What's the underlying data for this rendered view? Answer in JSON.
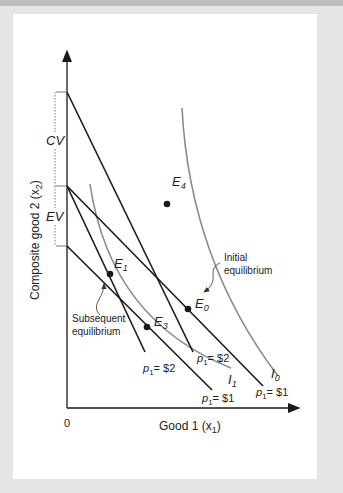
{
  "figure": {
    "y_axis_label": "Composite good 2 (x",
    "y_axis_sub": "2",
    "x_axis_label": "Good 1 (x",
    "x_axis_sub": "1",
    "origin_label": "0",
    "brackets": {
      "cv": "CV",
      "ev": "EV"
    },
    "points": {
      "e0": {
        "letter": "E",
        "sub": "0"
      },
      "e1": {
        "letter": "E",
        "sub": "1"
      },
      "e3": {
        "letter": "E",
        "sub": "3"
      },
      "e4": {
        "letter": "E",
        "sub": "4"
      }
    },
    "annotations": {
      "initial_line1": "Initial",
      "initial_line2": "equilibrium",
      "subsequent_line1": "Subsequent",
      "subsequent_line2": "equilibrium"
    },
    "curves": {
      "i0": {
        "letter": "I",
        "sub": "0"
      },
      "i1": {
        "letter": "I",
        "sub": "1"
      }
    },
    "price_labels": {
      "p_letter": "p",
      "p_sub": "1",
      "budget_e4": "= $2",
      "budget_e1": "= $2",
      "budget_e3": "= $1",
      "budget_e0": "= $1"
    }
  },
  "colors": {
    "budget_line": "#1a1a1a",
    "indifference_curve": "#8a8a8a",
    "background": "#e6e6e6",
    "panel": "#ffffff"
  }
}
